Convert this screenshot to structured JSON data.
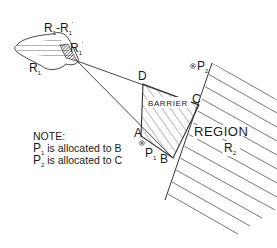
{
  "labels": {
    "source_region_diff": "R",
    "source_region_diff_sub1": "1",
    "source_region_diff_minus": "-R",
    "source_region_diff_sub2": "1",
    "source_region_diff_prime": "'",
    "source_region_prime": "R",
    "source_region_prime_sub": "1",
    "source_region_prime_mark": "'",
    "source_region": "R",
    "source_region_sub": "1",
    "vertex_a": "A",
    "vertex_b": "B",
    "vertex_c": "C",
    "vertex_d": "D",
    "barrier": "BARRIER",
    "region": "REGION",
    "region_r2": "R",
    "region_r2_sub": "2",
    "point_p1": "P",
    "point_p1_sub": "1",
    "point_p2": "P",
    "point_p2_sub": "2"
  },
  "note": {
    "heading": "NOTE:",
    "line1_p": "P",
    "line1_sub": "1",
    "line1_text": " is allocated to B",
    "line2_p": "P",
    "line2_sub": "2",
    "line2_text": " is allocated to C"
  },
  "colors": {
    "line": "#333333",
    "hatch": "#555555",
    "background": "#ffffff"
  }
}
